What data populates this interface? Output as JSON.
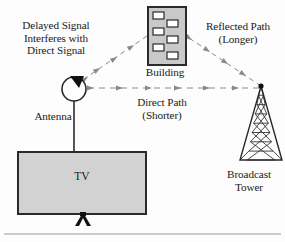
{
  "diagram": {
    "labels": {
      "delayed_signal": "Delayed Signal\nInterferes with\nDirect Signal",
      "building": "Building",
      "reflected_path": "Reflected Path\n(Longer)",
      "direct_path": "Direct Path\n(Shorter)",
      "antenna": "Antenna",
      "tv": "TV",
      "broadcast_tower": "Broadcast\nTower"
    },
    "colors": {
      "ink": "#1a1a1a",
      "outline": "#3a3a3a",
      "fill_gray": "#c9c9c9",
      "tv_fill": "#d2d2d2",
      "signal_gray": "#8a8a8a",
      "window_white": "#ffffff",
      "rule": "#9a9a9a",
      "background": "#fdfdfd"
    },
    "elements": {
      "building": {
        "name": "Building",
        "windows": 7,
        "fill": "#c9c9c9"
      },
      "antenna": {
        "name": "Antenna",
        "shape": "circle-loop"
      },
      "tv": {
        "name": "TV",
        "fill": "#d2d2d2"
      },
      "broadcast_tower": {
        "name": "Broadcast Tower",
        "shape": "lattice-triangle"
      }
    },
    "paths": [
      {
        "id": "direct-path",
        "label": "Direct Path (Shorter)",
        "from": "Broadcast Tower",
        "to": "Antenna",
        "style": "dashed-arrows",
        "arrowheads": 6
      },
      {
        "id": "reflected-path-up",
        "label": "Reflected Path (Longer)",
        "from": "Broadcast Tower",
        "to": "Building",
        "style": "dashed-arrows",
        "arrowheads": 4
      },
      {
        "id": "reflected-path-down",
        "label": "Reflected Path (Longer)",
        "from": "Building",
        "to": "Antenna",
        "style": "dashed-arrows",
        "arrowheads": 3
      }
    ]
  }
}
